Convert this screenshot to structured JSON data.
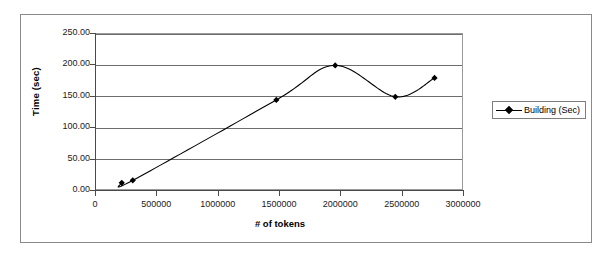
{
  "chart_data": {
    "type": "line",
    "title": "",
    "xlabel": "# of tokens",
    "ylabel": "Time (sec)",
    "xlim": [
      0,
      3000000
    ],
    "ylim": [
      0,
      250
    ],
    "grid": true,
    "legend_position": "right",
    "x_ticks": [
      "0",
      "500000",
      "1000000",
      "1500000",
      "2000000",
      "2500000",
      "3000000"
    ],
    "x_tick_values": [
      0,
      500000,
      1000000,
      1500000,
      2000000,
      2500000,
      3000000
    ],
    "y_ticks": [
      "0.00",
      "50.00",
      "100.00",
      "150.00",
      "200.00",
      "250.00"
    ],
    "y_tick_values": [
      0,
      50,
      100,
      150,
      200,
      250
    ],
    "series": [
      {
        "name": "Building (Sec)",
        "marker": "diamond",
        "color": "#000000",
        "x": [
          210000,
          300000,
          1470000,
          1950000,
          2440000,
          2760000
        ],
        "values": [
          13,
          17,
          145,
          200,
          150,
          180
        ]
      }
    ]
  },
  "legend": {
    "entries": [
      {
        "label": "Building (Sec)",
        "swatch": "line-diamond-marker"
      }
    ]
  },
  "colors": {
    "series": "#000000",
    "gridline": "#6d6d6d",
    "axis": "#4a4a4a",
    "frame": "#8a8a8a",
    "background": "#ffffff"
  }
}
